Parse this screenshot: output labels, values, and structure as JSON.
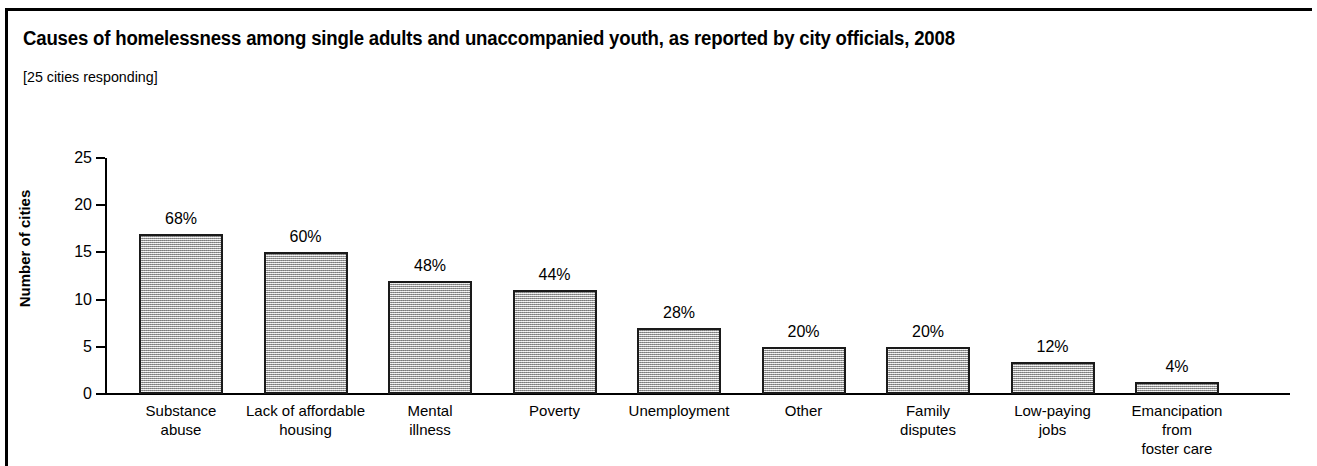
{
  "figure": {
    "title": "Causes of homelessness among single adults and unaccompanied youth, as reported by city officials, 2008",
    "subtitle": "[25 cities responding]"
  },
  "axes": {
    "y_title": "Number of cities",
    "y_ticks": [
      "0",
      "5",
      "10",
      "15",
      "20",
      "25"
    ]
  },
  "colors": {
    "bar_fill": "#c4c4c4",
    "bar_border": "#1a1a1a",
    "text": "#000000",
    "frame": "#000000"
  },
  "chart_data": {
    "type": "bar",
    "title": "Causes of homelessness among single adults and unaccompanied youth, as reported by city officials, 2008",
    "subtitle": "[25 cities responding]",
    "xlabel": "",
    "ylabel": "Number of cities",
    "ylim": [
      0,
      25
    ],
    "yticks": [
      0,
      5,
      10,
      15,
      20,
      25
    ],
    "grid": false,
    "legend": "none",
    "categories": [
      "Substance\nabuse",
      "Lack of affordable\nhousing",
      "Mental\nillness",
      "Poverty",
      "Unemployment",
      "Other",
      "Family\ndisputes",
      "Low-paying\njobs",
      "Emancipation\nfrom\nfoster care"
    ],
    "values": [
      17,
      15,
      12,
      11,
      7,
      5,
      5,
      3.4,
      1.3
    ],
    "data_labels": [
      "68%",
      "60%",
      "48%",
      "44%",
      "28%",
      "20%",
      "20%",
      "12%",
      "4%"
    ]
  }
}
